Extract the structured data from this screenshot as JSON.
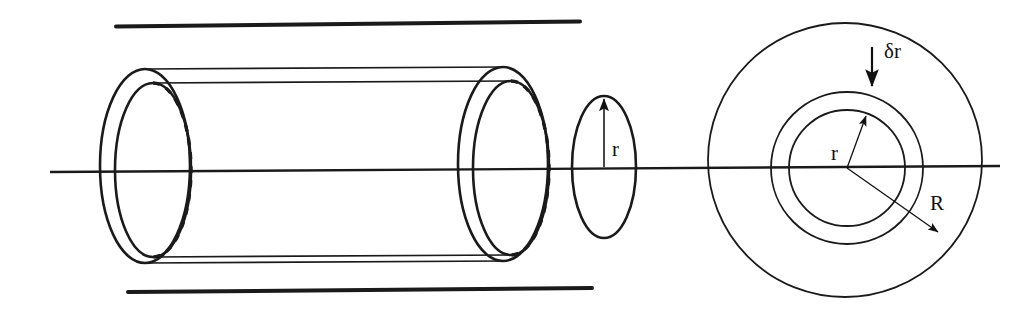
{
  "figure": {
    "stroke_color": "#1a1a1a",
    "background_color": "#ffffff"
  },
  "labels": {
    "radius_side": "r",
    "radius_inner": "r",
    "radius_outer": "R",
    "thickness": "δr"
  },
  "geometry": {
    "axis_line": {
      "x1": 50,
      "y1": 172,
      "x2": 1000,
      "y2": 166
    },
    "wall_top_line": {
      "x1": 116,
      "y1": 26,
      "x2": 580,
      "y2": 21
    },
    "wall_bottom_line": {
      "x1": 128,
      "y1": 292,
      "x2": 592,
      "y2": 288
    },
    "left_outer_ellipse": {
      "cx": 145,
      "cy": 166,
      "rx": 45,
      "ry": 97
    },
    "left_inner_ellipse": {
      "cx": 153,
      "cy": 170,
      "rx": 38,
      "ry": 87
    },
    "right_outer_ellipse": {
      "cx": 503,
      "cy": 164,
      "rx": 45,
      "ry": 97
    },
    "right_inner_ellipse": {
      "cx": 511,
      "cy": 168,
      "rx": 38,
      "ry": 87
    },
    "end_ellipse": {
      "cx": 604,
      "cy": 167,
      "rx": 32,
      "ry": 71
    },
    "body_lines": [
      {
        "x1": 145,
        "y1": 69,
        "x2": 503,
        "y2": 67
      },
      {
        "x1": 153,
        "y1": 83,
        "x2": 511,
        "y2": 81
      },
      {
        "x1": 153,
        "y1": 257,
        "x2": 511,
        "y2": 255
      },
      {
        "x1": 145,
        "y1": 263,
        "x2": 503,
        "y2": 261
      }
    ],
    "circle_outer": {
      "cx": 845,
      "cy": 160,
      "r": 137
    },
    "circle_middle": {
      "cx": 847,
      "cy": 168,
      "r": 76
    },
    "circle_inner": {
      "cx": 847,
      "cy": 168,
      "r": 58
    },
    "arrow_side_r": {
      "x1": 604,
      "y1": 167,
      "x2": 604,
      "y2": 96
    },
    "arrow_inner_r": {
      "x1": 847,
      "y1": 168,
      "x2": 864,
      "y2": 113
    },
    "arrow_outer_R": {
      "x1": 847,
      "y1": 168,
      "x2": 942,
      "y2": 235
    },
    "arrow_delta_r": {
      "x1": 872,
      "y1": 50,
      "x2": 872,
      "y2": 85
    }
  }
}
